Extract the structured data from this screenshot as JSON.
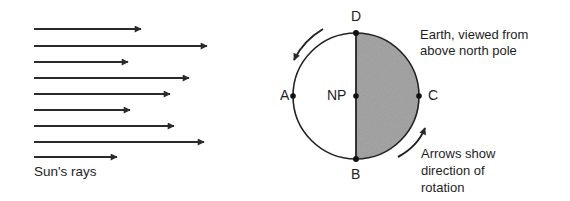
{
  "diagram": {
    "rays_label": "Sun's rays",
    "rays": [
      {
        "y": 29,
        "x1": 34,
        "x2": 141
      },
      {
        "y": 46,
        "x1": 34,
        "x2": 207
      },
      {
        "y": 62,
        "x1": 34,
        "x2": 128
      },
      {
        "y": 78,
        "x1": 34,
        "x2": 189
      },
      {
        "y": 94,
        "x1": 34,
        "x2": 170
      },
      {
        "y": 110,
        "x1": 34,
        "x2": 130
      },
      {
        "y": 126,
        "x1": 34,
        "x2": 174
      },
      {
        "y": 142,
        "x1": 34,
        "x2": 204
      },
      {
        "y": 157,
        "x1": 34,
        "x2": 117
      }
    ],
    "earth": {
      "cx": 356,
      "cy": 96,
      "r": 63,
      "night_fill": "#9a9a9a",
      "stroke": "#222222"
    },
    "points": {
      "A": "A",
      "B": "B",
      "C": "C",
      "D": "D",
      "NP": "NP"
    },
    "caption_top": [
      "Earth, viewed from",
      "above north pole"
    ],
    "caption_bottom": [
      "Arrows show",
      "direction of",
      "rotation"
    ]
  }
}
